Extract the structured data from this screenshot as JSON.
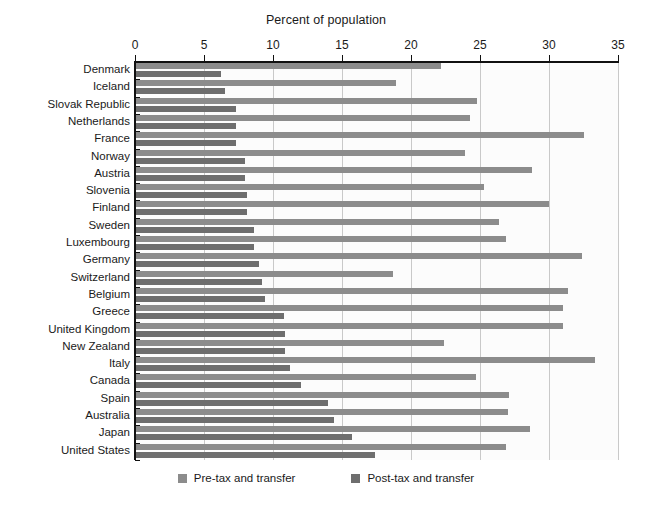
{
  "chart_data": {
    "type": "bar",
    "orientation": "horizontal",
    "title": "Percent of population",
    "xlabel": "",
    "ylabel": "",
    "xlim": [
      0,
      35
    ],
    "xticks": [
      0,
      5,
      10,
      15,
      20,
      25,
      30,
      35
    ],
    "xtick_labels": [
      "0",
      "5",
      "10",
      "15",
      "20",
      "25",
      "30",
      "35"
    ],
    "grid": true,
    "grid_axis": "x",
    "legend_position": "bottom-center",
    "categories": [
      "Denmark",
      "Iceland",
      "Slovak Republic",
      "Netherlands",
      "France",
      "Norway",
      "Austria",
      "Slovenia",
      "Finland",
      "Sweden",
      "Luxembourg",
      "Germany",
      "Switzerland",
      "Belgium",
      "Greece",
      "United Kingdom",
      "New Zealand",
      "Italy",
      "Canada",
      "Spain",
      "Australia",
      "Japan",
      "United States"
    ],
    "series": [
      {
        "name": "Pre-tax and transfer",
        "color": "#8c8c8c",
        "values": [
          22.2,
          18.9,
          24.8,
          24.3,
          32.5,
          23.9,
          28.8,
          25.3,
          30.0,
          26.4,
          26.9,
          32.4,
          18.7,
          31.4,
          31.0,
          31.0,
          22.4,
          33.3,
          24.7,
          27.1,
          27.0,
          28.6,
          26.9
        ]
      },
      {
        "name": "Post-tax and transfer",
        "color": "#6e6e6e",
        "values": [
          6.2,
          6.5,
          7.3,
          7.3,
          7.3,
          8.0,
          8.0,
          8.1,
          8.1,
          8.6,
          8.6,
          9.0,
          9.2,
          9.4,
          10.8,
          10.9,
          10.9,
          11.2,
          12.0,
          14.0,
          14.4,
          15.7,
          17.4
        ]
      }
    ]
  },
  "legend": {
    "items": [
      {
        "label": "Pre-tax and transfer",
        "color": "#8c8c8c"
      },
      {
        "label": "Post-tax and transfer",
        "color": "#6e6e6e"
      }
    ]
  }
}
